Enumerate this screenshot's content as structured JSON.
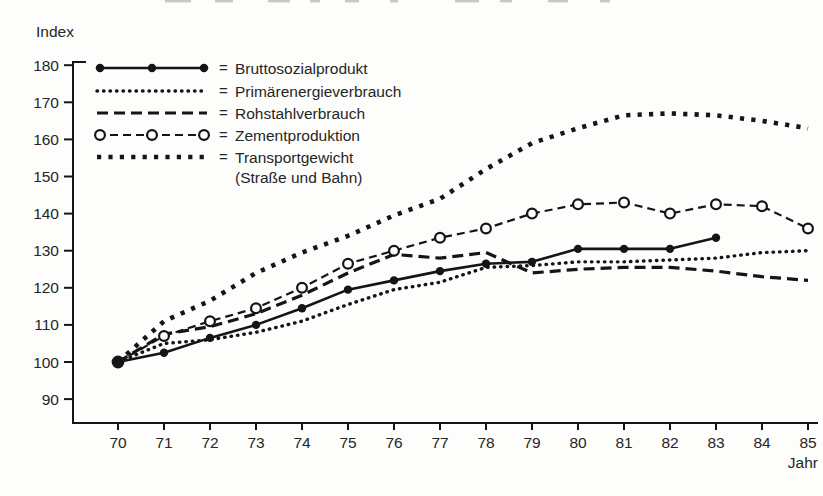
{
  "page": {
    "background": "#fdfdfb",
    "ink": "#151515",
    "tick_label_color": "#333333"
  },
  "chart_data": {
    "type": "line",
    "title": "",
    "ylabel": "Index",
    "xlabel": "Jahr",
    "legend_eq": "=",
    "legend_position": "top-left-inside",
    "grid": false,
    "ylim": [
      90,
      180
    ],
    "yticks": [
      90,
      100,
      110,
      120,
      130,
      140,
      150,
      160,
      170,
      180
    ],
    "x": [
      70,
      71,
      72,
      73,
      74,
      75,
      76,
      77,
      78,
      79,
      80,
      81,
      82,
      83,
      84,
      85
    ],
    "series": [
      {
        "id": "bruttosozialprodukt",
        "name": "Bruttosozialprodukt",
        "style": "solid-filled-circle",
        "values": [
          100,
          102.5,
          106.5,
          110,
          114.5,
          119.5,
          122,
          124.5,
          126.5,
          127,
          130.5,
          130.5,
          130.5,
          133.5,
          null,
          null
        ]
      },
      {
        "id": "primaerenergieverbrauch",
        "name": "Primärenergieverbrauch",
        "style": "fine-dotted",
        "values": [
          100,
          105,
          106,
          108,
          111,
          115.5,
          119.5,
          121.5,
          125.5,
          126,
          127,
          127,
          127.5,
          128,
          129.5,
          130
        ]
      },
      {
        "id": "rohstahlverbrauch",
        "name": "Rohstahlverbrauch",
        "style": "dashed",
        "values": [
          100,
          107.5,
          109.5,
          113,
          118,
          124,
          129,
          128,
          129.5,
          124,
          125,
          125.5,
          125.5,
          124.5,
          123,
          122
        ]
      },
      {
        "id": "zementproduktion",
        "name": "Zementproduktion",
        "style": "dashed-open-circle",
        "values": [
          100,
          107,
          111,
          114.5,
          120,
          126.5,
          130,
          133.5,
          136,
          140,
          142.5,
          143,
          140,
          142.5,
          142,
          136
        ]
      },
      {
        "id": "transportgewicht",
        "name": "Transportgewicht",
        "sublabel": "(Straße und Bahn)",
        "style": "bold-dotted",
        "values": [
          100,
          111,
          116.5,
          124,
          129.5,
          134,
          139.5,
          144,
          152,
          159,
          163,
          166.5,
          167,
          166.5,
          165,
          163
        ]
      }
    ]
  }
}
